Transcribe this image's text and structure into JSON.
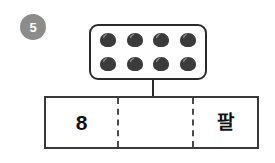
{
  "worksheet": {
    "question_number": "5",
    "badge_color": "#8c8c8c",
    "object_box": {
      "icon_name": "chestnut-icon",
      "object_count": 8,
      "rows": 2,
      "columns": 4,
      "object_color": "#3b3b3b",
      "objects": [
        {
          "id": "chestnut-1"
        },
        {
          "id": "chestnut-2"
        },
        {
          "id": "chestnut-3"
        },
        {
          "id": "chestnut-4"
        },
        {
          "id": "chestnut-5"
        },
        {
          "id": "chestnut-6"
        },
        {
          "id": "chestnut-7"
        },
        {
          "id": "chestnut-8"
        }
      ]
    },
    "answer_table": {
      "cells": [
        {
          "value": "8",
          "is_korean": false,
          "filled": true
        },
        {
          "value": "",
          "is_korean": false,
          "filled": false
        },
        {
          "value": "팔",
          "is_korean": true,
          "filled": true
        }
      ]
    }
  }
}
